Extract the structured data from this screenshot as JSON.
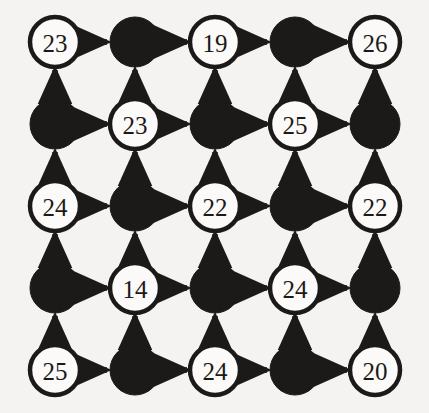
{
  "figure": {
    "type": "directed-grid-graph",
    "background_color": "#f4f3f1",
    "ink_color": "#1c1a19",
    "node_fill_open": "#fbfaf8",
    "node_fill_filled": "#1c1a19",
    "rows": 5,
    "cols": 5,
    "node_radius": 25,
    "col_x": [
      55,
      135,
      215,
      295,
      375
    ],
    "row_y": [
      42,
      124,
      206,
      288,
      370
    ],
    "horizontal_arrow_direction": "right",
    "vertical_arrow_direction": "up"
  },
  "chart_data": {
    "type": "diagram",
    "title": "",
    "grid_rows": [
      {
        "row": 1,
        "cells": [
          {
            "col": 1,
            "filled": false,
            "label": "23"
          },
          {
            "col": 2,
            "filled": true,
            "label": ""
          },
          {
            "col": 3,
            "filled": false,
            "label": "19"
          },
          {
            "col": 4,
            "filled": true,
            "label": ""
          },
          {
            "col": 5,
            "filled": false,
            "label": "26"
          }
        ]
      },
      {
        "row": 2,
        "cells": [
          {
            "col": 1,
            "filled": true,
            "label": ""
          },
          {
            "col": 2,
            "filled": false,
            "label": "23"
          },
          {
            "col": 3,
            "filled": true,
            "label": ""
          },
          {
            "col": 4,
            "filled": false,
            "label": "25"
          },
          {
            "col": 5,
            "filled": true,
            "label": ""
          }
        ]
      },
      {
        "row": 3,
        "cells": [
          {
            "col": 1,
            "filled": false,
            "label": "24"
          },
          {
            "col": 2,
            "filled": true,
            "label": ""
          },
          {
            "col": 3,
            "filled": false,
            "label": "22"
          },
          {
            "col": 4,
            "filled": true,
            "label": ""
          },
          {
            "col": 5,
            "filled": false,
            "label": "22"
          }
        ]
      },
      {
        "row": 4,
        "cells": [
          {
            "col": 1,
            "filled": true,
            "label": ""
          },
          {
            "col": 2,
            "filled": false,
            "label": "14"
          },
          {
            "col": 3,
            "filled": true,
            "label": ""
          },
          {
            "col": 4,
            "filled": false,
            "label": "24"
          },
          {
            "col": 5,
            "filled": true,
            "label": ""
          }
        ]
      },
      {
        "row": 5,
        "cells": [
          {
            "col": 1,
            "filled": false,
            "label": "25"
          },
          {
            "col": 2,
            "filled": true,
            "label": ""
          },
          {
            "col": 3,
            "filled": false,
            "label": "24"
          },
          {
            "col": 4,
            "filled": true,
            "label": ""
          },
          {
            "col": 5,
            "filled": false,
            "label": "20"
          }
        ]
      }
    ],
    "labels_flat": [
      "23",
      "19",
      "26",
      "23",
      "25",
      "24",
      "22",
      "22",
      "14",
      "24",
      "25",
      "24",
      "20"
    ],
    "edges": {
      "horizontal_count": 20,
      "vertical_count": 20
    }
  }
}
